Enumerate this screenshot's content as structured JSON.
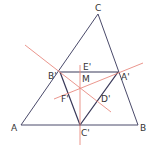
{
  "colors": {
    "triangle": "#4a4a6a",
    "medial": "#3a3a5a",
    "bisector": "#e88a80",
    "label": "#333333"
  },
  "points": {
    "A": {
      "label": "A",
      "x": 21,
      "y": 125
    },
    "B": {
      "label": "B",
      "x": 138,
      "y": 125
    },
    "C": {
      "label": "C",
      "x": 98,
      "y": 14
    },
    "A_prime": {
      "label": "A'",
      "x": 118,
      "y": 72
    },
    "B_prime": {
      "label": "B'",
      "x": 60,
      "y": 72
    },
    "C_prime": {
      "label": "C'",
      "x": 80,
      "y": 125
    },
    "M": {
      "label": "M",
      "x": 80,
      "y": 88
    },
    "D_prime": {
      "label": "D'",
      "x": 99,
      "y": 98
    },
    "E_prime": {
      "label": "E'",
      "x": 80,
      "y": 72
    },
    "F_prime": {
      "label": "F'",
      "x": 70,
      "y": 95
    }
  },
  "labels": {
    "A": "A",
    "B": "B",
    "C": "C",
    "A_prime": "A'",
    "B_prime": "B'",
    "C_prime": "C'",
    "M": "M",
    "D_prime": "D'",
    "E_prime": "E'",
    "F_prime": "F'"
  }
}
